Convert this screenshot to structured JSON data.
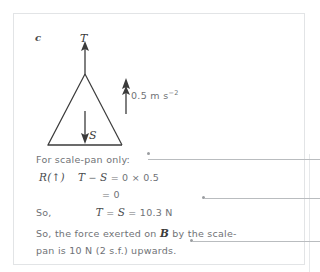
{
  "page": {
    "part_label": "c"
  },
  "diagram": {
    "name": "scale-pan-free-body-diagram",
    "tension_label": "T",
    "weight_label": "S",
    "acceleration_value": "0.5",
    "acceleration_unit_base": " m s",
    "acceleration_unit_exponent": "−2",
    "acceleration_full": "0.5 m s−2",
    "shape": "triangle",
    "arrows": [
      {
        "name": "tension-arrow",
        "direction": "up",
        "label": "T"
      },
      {
        "name": "weight-arrow",
        "direction": "down",
        "label": "S"
      },
      {
        "name": "acceleration-arrow",
        "direction": "up",
        "label": "0.5 m s−2"
      }
    ]
  },
  "working": {
    "intro": "For scale-pan only:",
    "eq1_prefix": "R(↑)",
    "eq1_body": "T − S = 0 × 0.5",
    "eq1_lhs_T": "T",
    "eq1_minus": " − ",
    "eq1_lhs_S": "S",
    "eq1_rhs": " = 0 × 0.5",
    "eq2": "= 0",
    "eq3_prefix": "So,",
    "eq3_T": "T",
    "eq3_mid": " = ",
    "eq3_S": "S",
    "eq3_rhs": " = 10.3 N",
    "conclusion_line1_pre": "So, the force exerted on ",
    "conclusion_line1_bold": "B",
    "conclusion_line1_post": " by the scale-",
    "conclusion_line2": "pan is 10 N (2 s.f.) upwards."
  },
  "callouts": [
    {
      "name": "callout-line-equation",
      "target": "eq1"
    },
    {
      "name": "callout-line-tension-result",
      "target": "eq3"
    },
    {
      "name": "callout-line-conclusion",
      "target": "conclusion"
    }
  ],
  "colors": {
    "text": "#6f7276",
    "math": "#4a4c4f",
    "stroke": "#3b3b3b",
    "card_border": "#e2e4e6",
    "callout": "#b9bcbf"
  }
}
